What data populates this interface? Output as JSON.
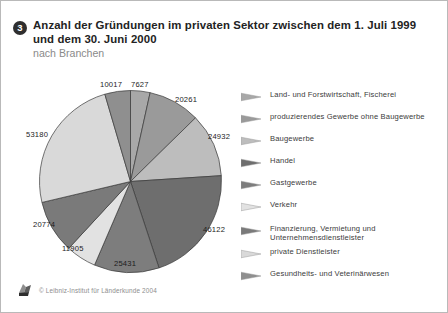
{
  "header": {
    "bullet": "3",
    "title": "Anzahl der Gründungen im privaten Sektor zwischen dem 1. Juli 1999 und dem 30. Juni 2000",
    "subtitle": "nach Branchen"
  },
  "footer": {
    "copyright": "© Leibniz-Institut für Länderkunde 2004",
    "logo_icon": "leibniz-ifl-logo-icon"
  },
  "chart_data": {
    "type": "pie",
    "title": "Anzahl der Gründungen im privaten Sektor zwischen dem 1. Juli 1999 und dem 30. Juni 2000",
    "subtitle": "nach Branchen",
    "unit": "Gründungen",
    "total": 220249,
    "start_angle_deg": 0,
    "direction": "clockwise",
    "legend_position": "right",
    "grid": false,
    "categories": [
      "Land- und Forstwirtschaft, Fischerei",
      "produzierendes Gewerbe ohne Baugewerbe",
      "Baugewerbe",
      "Handel",
      "Gastgewerbe",
      "Verkehr",
      "Finanzierung, Vermietung und Unternehmensdienstleister",
      "private Dienstleister",
      "Gesundheits- und Veterinärwesen"
    ],
    "values": [
      7627,
      20261,
      24932,
      46122,
      25431,
      11905,
      20774,
      53180,
      10017
    ],
    "colors": [
      "#a8a8a8",
      "#9a9a9a",
      "#bdbdbd",
      "#6e6e6e",
      "#7d7d7d",
      "#e2e2e2",
      "#7a7a7a",
      "#d9d9d9",
      "#8f8f8f"
    ],
    "labels": [
      {
        "value": "7627",
        "x": 130,
        "y": 79
      },
      {
        "value": "20261",
        "x": 174,
        "y": 94
      },
      {
        "value": "24932",
        "x": 207,
        "y": 131
      },
      {
        "value": "46122",
        "x": 202,
        "y": 224
      },
      {
        "value": "25431",
        "x": 113,
        "y": 258
      },
      {
        "value": "11905",
        "x": 61,
        "y": 243
      },
      {
        "value": "20774",
        "x": 32,
        "y": 219
      },
      {
        "value": "53180",
        "x": 25,
        "y": 129
      },
      {
        "value": "10017",
        "x": 99,
        "y": 79
      }
    ]
  }
}
